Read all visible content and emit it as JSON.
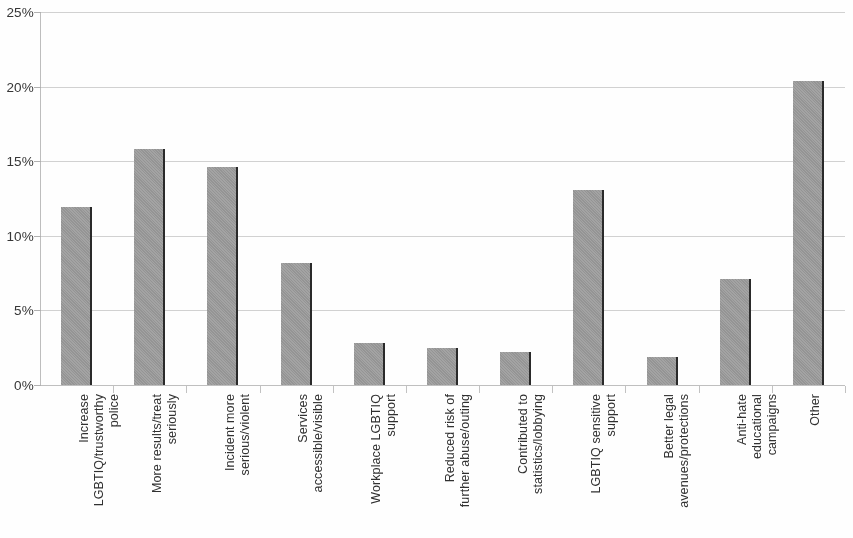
{
  "chart_data": {
    "type": "bar",
    "title": "",
    "subtitle": "",
    "xlabel": "",
    "ylabel": "",
    "ylim": [
      0,
      25
    ],
    "y_tick_labels": [
      "25%",
      "20%",
      "15%",
      "10%",
      "5%",
      "0%"
    ],
    "y_tick_values": [
      25,
      20,
      15,
      10,
      5,
      0
    ],
    "grid": true,
    "legend": "none",
    "value_suffix": "%",
    "bar_color": "#9c9c9c",
    "bar_edge_color": "#272727",
    "gridline_color": "#c9c9c9",
    "categories": [
      "Increase\nLGBTIQ/trustworthy\npolice",
      "More results/treat\nseriously",
      "Incident more\nserious/violent",
      "Services\naccessible/visible",
      "Workplace LGBTIQ\nsupport",
      "Reduced risk of\nfurther abuse/outing",
      "Contributed to\nstatistics/lobbying",
      "LGBTIQ sensitive\nsupport",
      "Better legal\navenues/protections",
      "Anti-hate\neducational\ncampaigns",
      "Other"
    ],
    "values": [
      11.9,
      15.8,
      14.6,
      8.2,
      2.8,
      2.5,
      2.2,
      13.1,
      1.9,
      7.1,
      20.4
    ]
  }
}
